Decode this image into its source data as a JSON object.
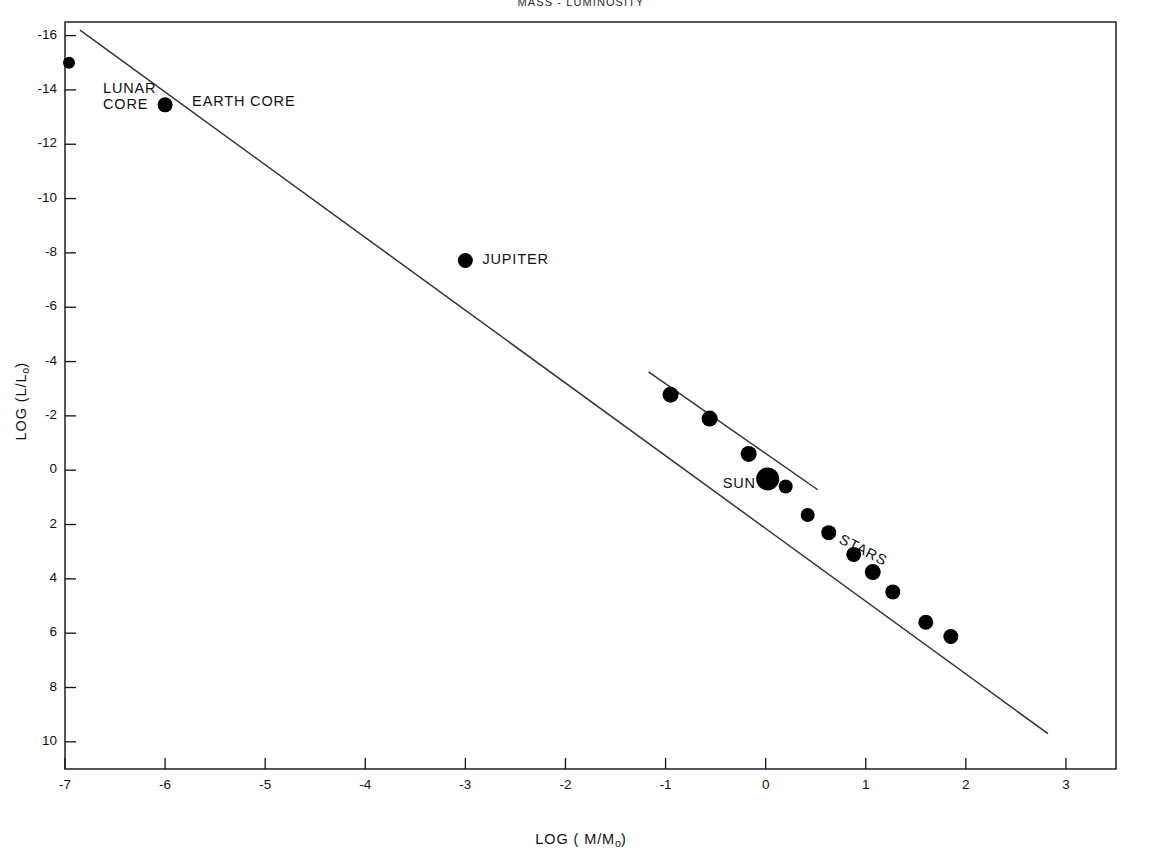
{
  "chart_data": {
    "type": "scatter",
    "title": "MASS - LUMINOSITY",
    "xlabel": "LOG ( M/M",
    "xlabel_sub": "o",
    "xlabel_tail": ")",
    "ylabel": "LOG (L/L",
    "ylabel_sub": "o",
    "ylabel_tail": ")",
    "xlim": [
      -7,
      3.5
    ],
    "ylim": [
      11,
      -16.5
    ],
    "y_inverted": true,
    "grid": false,
    "legend": "none",
    "xticks": [
      -7,
      -6,
      -5,
      -4,
      -3,
      -2,
      -1,
      0,
      1,
      2,
      3
    ],
    "xtick_labels": [
      "-7",
      "-6",
      "-5",
      "-4",
      "-3",
      "-2",
      "-1",
      "0",
      "1",
      "2",
      "3"
    ],
    "yticks": [
      -16,
      -14,
      -12,
      -10,
      -8,
      -6,
      -4,
      -2,
      0,
      2,
      4,
      6,
      8,
      10
    ],
    "ytick_labels": [
      "-16",
      "-14",
      "-12",
      "-10",
      "-8",
      "-6",
      "-4",
      "-2",
      "0",
      "2",
      "4",
      "6",
      "8",
      "10"
    ],
    "points": [
      {
        "name": "lunar-core",
        "x": -6.96,
        "y": -15.0,
        "r": 6.0
      },
      {
        "name": "earth-core",
        "x": -6.0,
        "y": -13.45,
        "r": 7.5
      },
      {
        "name": "jupiter",
        "x": -3.0,
        "y": -7.72,
        "r": 7.5
      },
      {
        "name": "star-1",
        "x": -0.95,
        "y": -2.78,
        "r": 8.0
      },
      {
        "name": "star-2",
        "x": -0.56,
        "y": -1.9,
        "r": 8.0
      },
      {
        "name": "star-3",
        "x": -0.17,
        "y": -0.6,
        "r": 8.0
      },
      {
        "name": "sun",
        "x": 0.02,
        "y": 0.32,
        "r": 11.5
      },
      {
        "name": "star-4",
        "x": 0.2,
        "y": 0.6,
        "r": 7.0
      },
      {
        "name": "star-5",
        "x": 0.42,
        "y": 1.65,
        "r": 7.0
      },
      {
        "name": "star-6",
        "x": 0.63,
        "y": 2.3,
        "r": 7.5
      },
      {
        "name": "star-7",
        "x": 0.88,
        "y": 3.1,
        "r": 7.5
      },
      {
        "name": "star-8",
        "x": 1.07,
        "y": 3.75,
        "r": 8.0
      },
      {
        "name": "star-9",
        "x": 1.27,
        "y": 4.48,
        "r": 7.5
      },
      {
        "name": "star-10",
        "x": 1.6,
        "y": 5.6,
        "r": 7.5
      },
      {
        "name": "star-11",
        "x": 1.85,
        "y": 6.12,
        "r": 7.5
      }
    ],
    "lines": [
      {
        "name": "main-trend",
        "x1": -6.85,
        "y1": -16.2,
        "x2": 2.82,
        "y2": 9.7
      },
      {
        "name": "stellar-trend",
        "x1": -1.17,
        "y1": -3.62,
        "x2": 0.52,
        "y2": 0.72
      }
    ],
    "annotations": [
      {
        "name": "lunar-core-label",
        "text_line1": "LUNAR",
        "text_line2": "CORE",
        "x": -6.62,
        "y": -14.0
      },
      {
        "name": "earth-core-label",
        "text_line1": "EARTH CORE",
        "text_line2": "",
        "x": -5.73,
        "y": -13.5
      },
      {
        "name": "jupiter-label",
        "text_line1": "JUPITER",
        "text_line2": "",
        "x": -2.83,
        "y": -7.7
      },
      {
        "name": "sun-label",
        "text_line1": "SUN",
        "text_line2": "",
        "x": -0.43,
        "y": 0.55
      },
      {
        "name": "stars-label",
        "text_line1": "STARS",
        "text_line2": "",
        "x": 0.78,
        "y": 2.6,
        "rotated": true
      }
    ]
  },
  "colors": {
    "marker": "#000000",
    "line": "#333333",
    "axis": "#111111",
    "background": "#ffffff"
  }
}
